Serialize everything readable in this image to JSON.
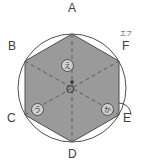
{
  "figure": {
    "type": "geometry-diagram",
    "colors": {
      "hexagon_fill": "#9a9a9a",
      "stroke": "#4f4f4f",
      "dashed_stroke": "#5a5a5a",
      "label_color": "#3c3c3c",
      "background": "#ffffff"
    },
    "circle": {
      "center_label": "O",
      "center_x": 72,
      "center_y": 88,
      "radius": 54
    },
    "vertices": [
      {
        "id": "vertex-a",
        "label": "A",
        "x": 72,
        "y": 34,
        "label_x": 68,
        "label_y": 2
      },
      {
        "id": "vertex-b",
        "label": "B",
        "x": 25,
        "y": 61,
        "label_x": 8,
        "label_y": 40
      },
      {
        "id": "vertex-c",
        "label": "C",
        "x": 25,
        "y": 115,
        "label_x": 7,
        "label_y": 112
      },
      {
        "id": "vertex-d",
        "label": "D",
        "x": 72,
        "y": 142,
        "label_x": 68,
        "label_y": 148
      },
      {
        "id": "vertex-e",
        "label": "E",
        "x": 119,
        "y": 115,
        "label_x": 123,
        "label_y": 112
      },
      {
        "id": "vertex-f",
        "label": "F",
        "x": 119,
        "y": 61,
        "label_x": 122,
        "label_y": 40
      }
    ],
    "furigana": [
      {
        "id": "furigana-f",
        "text": "エフ",
        "x": 120,
        "y": 30
      }
    ],
    "angle_markers": [
      {
        "id": "marker-e",
        "text": "え",
        "x": 61,
        "y": 59
      },
      {
        "id": "marker-u",
        "text": "う",
        "x": 31,
        "y": 103
      },
      {
        "id": "marker-ka",
        "text": "か",
        "x": 101,
        "y": 103
      }
    ],
    "center_dot": {
      "x": 72,
      "y": 82
    },
    "arc_marker": {
      "id": "arc-at-e",
      "description": "small arc drawn at vertex E"
    }
  }
}
